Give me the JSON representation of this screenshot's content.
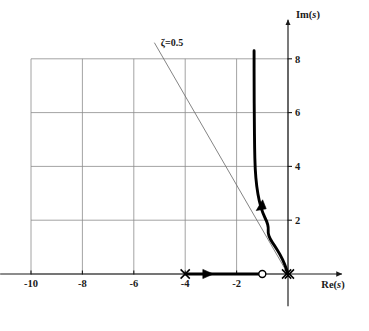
{
  "figure": {
    "kind": "root-locus",
    "background_color": "#ffffff",
    "ink_color": "#1a1a1a",
    "grid_color": "#8c8c8c",
    "locus_color": "#000000",
    "thin_line_color": "#6e6e6e"
  },
  "axes": {
    "x_label": "Re(s)",
    "y_label": "Im(s)",
    "x_tick_labels": [
      "-10",
      "-8",
      "-6",
      "-4",
      "-2"
    ],
    "x_tick_values": [
      -10,
      -8,
      -6,
      -4,
      -2
    ],
    "y_tick_labels": [
      "2",
      "4",
      "6",
      "8"
    ],
    "y_tick_values": [
      2,
      4,
      6,
      8
    ],
    "xlim": [
      -11.2,
      1.2
    ],
    "ylim": [
      -1.2,
      9.3
    ],
    "grid": true
  },
  "annotations": {
    "damping_line_label": "ζ=0.5",
    "damping_ratio": 0.5,
    "damping_line_angle_deg": 120,
    "damping_line_start": [
      0,
      0
    ],
    "damping_line_end": [
      -5.2,
      8.6
    ]
  },
  "chart_data": {
    "type": "line",
    "title": "",
    "xlabel": "Re(s)",
    "ylabel": "Im(s)",
    "xlim": [
      -11.2,
      1.2
    ],
    "ylim": [
      -1.2,
      9.3
    ],
    "grid": true,
    "legend": null,
    "poles": [
      {
        "re": 0,
        "im": 0,
        "marker": "x",
        "multiplicity": 2
      },
      {
        "re": -4,
        "im": 0,
        "marker": "x",
        "multiplicity": 1
      }
    ],
    "zeros": [
      {
        "re": -1,
        "im": 0,
        "marker": "o",
        "multiplicity": 1
      }
    ],
    "series": [
      {
        "name": "real-axis branch",
        "style": "thick",
        "points": [
          [
            -4,
            0
          ],
          [
            -1,
            0
          ]
        ]
      },
      {
        "name": "complex branch",
        "style": "thick",
        "points": [
          [
            0,
            0
          ],
          [
            -0.12,
            0.35
          ],
          [
            -0.3,
            0.72
          ],
          [
            -0.52,
            1.05
          ],
          [
            -0.7,
            1.3
          ],
          [
            -0.78,
            1.52
          ],
          [
            -0.76,
            1.72
          ],
          [
            -0.82,
            1.95
          ],
          [
            -0.98,
            2.25
          ],
          [
            -1.12,
            2.7
          ],
          [
            -1.22,
            3.25
          ],
          [
            -1.28,
            3.9
          ],
          [
            -1.3,
            4.7
          ],
          [
            -1.31,
            5.7
          ],
          [
            -1.32,
            7.0
          ],
          [
            -1.32,
            8.3
          ]
        ]
      }
    ],
    "arrows": [
      {
        "on": "real-axis branch",
        "re": -3.1,
        "im": 0,
        "direction": "right"
      },
      {
        "on": "complex branch",
        "re": -1.05,
        "im": 2.55,
        "direction": "up"
      }
    ],
    "damping_line": {
      "label": "ζ=0.5",
      "style": "thin",
      "points": [
        [
          0,
          0
        ],
        [
          -5.2,
          8.6
        ]
      ]
    }
  }
}
